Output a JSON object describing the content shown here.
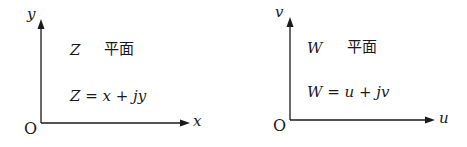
{
  "left_plane": {
    "y_axis_label": "y",
    "x_axis_label": "x",
    "origin_label": "O",
    "title_var": "Z",
    "title_text": "平面",
    "equation": "Z = x + jy"
  },
  "right_plane": {
    "y_axis_label": "v",
    "x_axis_label": "u",
    "origin_label": "O",
    "title_var": "W",
    "title_text": "平面",
    "equation": "W = u + jv"
  },
  "colors": {
    "ink": "#1a1a1a",
    "background": "#ffffff"
  }
}
